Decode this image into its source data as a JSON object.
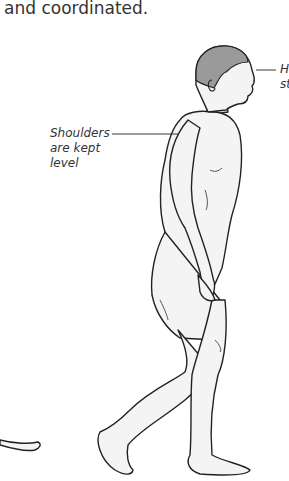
{
  "text": {
    "paragraph_tail": "and coordinated."
  },
  "figure": {
    "callouts": [
      {
        "lines": [
          "He",
          "st"
        ],
        "position": "right-of-head"
      },
      {
        "lines": [
          "Shoulders",
          "are kept",
          "level"
        ],
        "position": "left-of-shoulder"
      }
    ]
  },
  "colors": {
    "text": "#333333",
    "line": "#222222",
    "hair": "#9a9a9a",
    "skin": "#f4f4f4"
  }
}
